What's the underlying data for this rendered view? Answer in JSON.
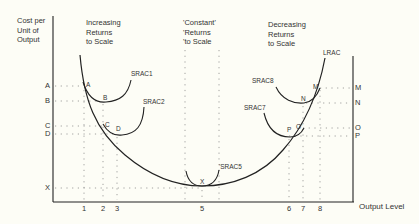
{
  "y_axis_title": "Cost per\nUnit of\nOutput",
  "x_axis_title": "Output Level",
  "regions": [
    {
      "label": "Increasing\nReturns\nto Scale"
    },
    {
      "label": "'Constant'\n'Returns\n'to Scale"
    },
    {
      "label": "Decreasing\nReturns\nto Scale"
    }
  ],
  "left_axis_levels": [
    "A",
    "B",
    "C",
    "D",
    "X"
  ],
  "right_axis_levels": [
    "M",
    "N",
    "O",
    "P"
  ],
  "x_ticks": [
    "1",
    "2",
    "3",
    "5",
    "6",
    "7",
    "8"
  ],
  "curves": {
    "long_run": "LRAC",
    "short_run": [
      "SRAC1",
      "SRAC2",
      "SRAC5",
      "SRAC7",
      "SRAC8"
    ]
  },
  "curve_labels": {
    "srac1": "SRAC1",
    "srac2": "SRAC2",
    "srac5": "'SRAC5",
    "srac7": "SRAC7",
    "srac8": "SRAC8",
    "lrac": "LRAC"
  },
  "point_labels": {
    "a": "A",
    "b": "B",
    "c": "C",
    "d": "D",
    "x": "X",
    "m": "M",
    "n": "N",
    "o": "O'",
    "p": "P"
  },
  "colors": {
    "line": "#222222",
    "dotted": "#888888",
    "background": "#fdfdf6"
  }
}
